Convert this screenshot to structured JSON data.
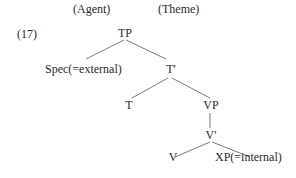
{
  "header": {
    "agent_label": "(Agent)",
    "theme_label": "(Theme)"
  },
  "example_number": "(17)",
  "tree": {
    "nodes": {
      "tp": "TP",
      "spec": "Spec(=external)",
      "t_bar": "T'",
      "t": "T",
      "vp": "VP",
      "v_bar": "V'",
      "v": "V",
      "xp": "XP(=internal)"
    },
    "edges": [
      [
        "TP",
        "Spec(=external)"
      ],
      [
        "TP",
        "T'"
      ],
      [
        "T'",
        "T"
      ],
      [
        "T'",
        "VP"
      ],
      [
        "VP",
        "V'"
      ],
      [
        "V'",
        "V"
      ],
      [
        "V'",
        "XP(=internal)"
      ]
    ]
  },
  "colors": {
    "text": "#2a2a2a",
    "lines": "#6a6a6a",
    "background": "#ffffff"
  }
}
